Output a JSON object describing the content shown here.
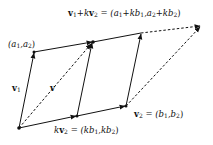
{
  "diagram": {
    "type": "vector-parallelogram",
    "points": {
      "origin": {
        "x": 19,
        "y": 128
      },
      "kv2": {
        "x": 77,
        "y": 116
      },
      "v2": {
        "x": 126,
        "y": 106
      },
      "a": {
        "x": 34,
        "y": 52
      },
      "v1_plus_kv2": {
        "x": 93,
        "y": 42
      },
      "v1_plus_v2_top": {
        "x": 141,
        "y": 33
      },
      "top_right": {
        "x": 201,
        "y": 26
      }
    },
    "colors": {
      "stroke": "#111111",
      "background": "#ffffff"
    }
  },
  "labels": {
    "top": {
      "vec_v1": "v",
      "sub1": "1",
      "plus_k": "+k",
      "vec_v2": "v",
      "sub2": "2",
      "eq": " = (a",
      "s1": "1",
      "mid1": "+kb",
      "s2": "1",
      "comma": ",a",
      "s3": "2",
      "mid2": "+kb",
      "s4": "2",
      "close": ")"
    },
    "a_point": {
      "open": "(a",
      "s1": "1",
      "comma": ",a",
      "s2": "2",
      "close": ")"
    },
    "v1": {
      "vec": "v",
      "sub": "1"
    },
    "v": {
      "vec": "v"
    },
    "kv2": {
      "k": "k",
      "vec": "v",
      "sub": "2",
      "eq": " = (kb",
      "s1": "1",
      "comma": ",kb",
      "s2": "2",
      "close": ")"
    },
    "v2": {
      "vec": "v",
      "sub": "2",
      "eq": " = (b",
      "s1": "1",
      "comma": ",b",
      "s2": "2",
      "close": ")"
    }
  }
}
